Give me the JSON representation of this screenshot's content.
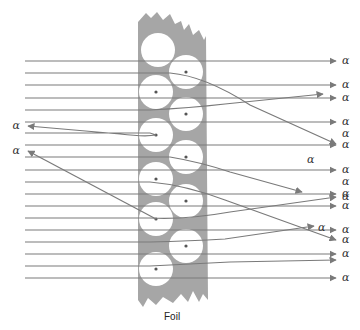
{
  "diagram": {
    "foil_label": "Foil",
    "particle_label": "α",
    "colors": {
      "foil": "#a6a6a6",
      "atom": "#ffffff",
      "nucleus": "#555555",
      "ray": "#7a7a7a",
      "text": "#333333"
    },
    "straight_rays": 12,
    "deflected_rays": 5,
    "back_scattered_rays": 2,
    "atom_count": 11
  }
}
